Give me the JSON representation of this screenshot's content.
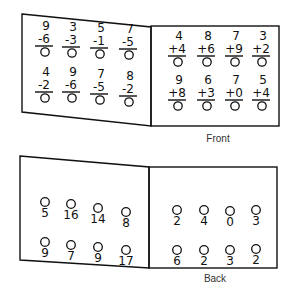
{
  "front": {
    "caption": "Front",
    "left_panel": {
      "operation": "subtraction",
      "problems": [
        {
          "top": "9",
          "bottom": "-6"
        },
        {
          "top": "3",
          "bottom": "-3"
        },
        {
          "top": "5",
          "bottom": "-1"
        },
        {
          "top": "7",
          "bottom": "-5"
        },
        {
          "top": "4",
          "bottom": "-2"
        },
        {
          "top": "9",
          "bottom": "-6"
        },
        {
          "top": "7",
          "bottom": "-5"
        },
        {
          "top": "8",
          "bottom": "-2"
        }
      ]
    },
    "right_panel": {
      "operation": "addition",
      "problems": [
        {
          "top": "4",
          "bottom": "+4"
        },
        {
          "top": "8",
          "bottom": "+6"
        },
        {
          "top": "7",
          "bottom": "+9"
        },
        {
          "top": "3",
          "bottom": "+2"
        },
        {
          "top": "9",
          "bottom": "+8"
        },
        {
          "top": "6",
          "bottom": "+3"
        },
        {
          "top": "7",
          "bottom": "+0"
        },
        {
          "top": "5",
          "bottom": "+4"
        }
      ]
    }
  },
  "back": {
    "caption": "Back",
    "left_panel": {
      "answers": [
        "5",
        "16",
        "14",
        "8",
        "9",
        "7",
        "9",
        "17"
      ]
    },
    "right_panel": {
      "answers": [
        "2",
        "4",
        "0",
        "3",
        "6",
        "2",
        "3",
        "2"
      ]
    }
  }
}
